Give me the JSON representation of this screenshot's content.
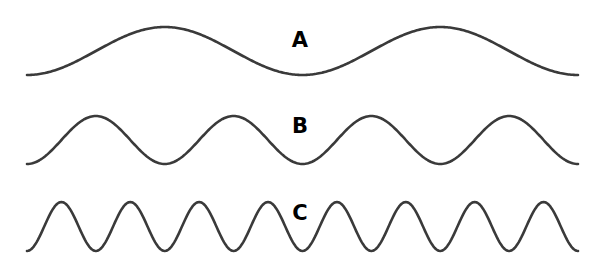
{
  "figure": {
    "background": "#ffffff",
    "stroke_color": "#3a3a3a",
    "label_color": "#000000",
    "waves": [
      {
        "id": "A",
        "label": "A",
        "x_start": 27,
        "x_end": 578,
        "baseline_y": 75,
        "amplitude": 48,
        "periods": 2,
        "label_x": 300,
        "label_y": 30
      },
      {
        "id": "B",
        "label": "B",
        "x_start": 27,
        "x_end": 578,
        "baseline_y": 164,
        "amplitude": 48,
        "periods": 4,
        "label_x": 300,
        "label_y": 116
      },
      {
        "id": "C",
        "label": "C",
        "x_start": 27,
        "x_end": 578,
        "baseline_y": 251,
        "amplitude": 49,
        "periods": 8,
        "label_x": 300,
        "label_y": 203
      }
    ]
  }
}
